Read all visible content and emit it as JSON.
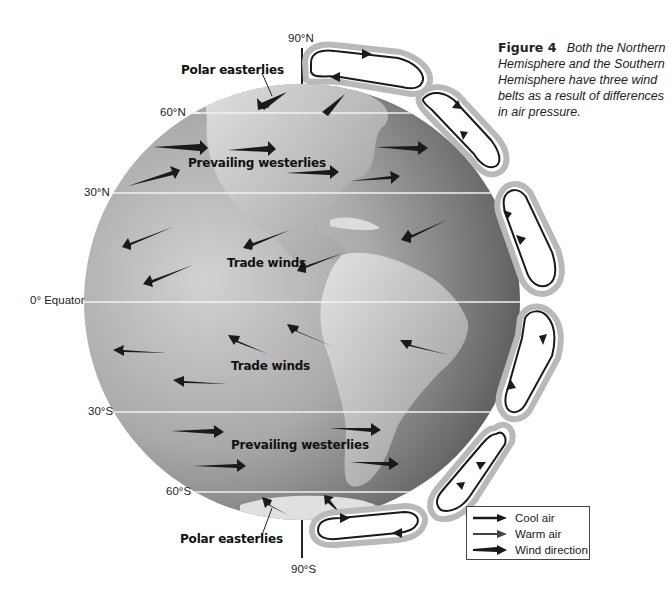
{
  "caption": {
    "figure_label": "Figure 4",
    "text": "Both the Northern Hemisphere and the Southern Hemisphere have three wind belts as a result of differences in air pressure."
  },
  "latitude_labels": {
    "n90": "90°N",
    "n60": "60°N",
    "n30": "30°N",
    "equator": "0° Equator",
    "s30": "30°S",
    "s60": "60°S",
    "s90": "90°S"
  },
  "wind_labels": {
    "polar_easterlies_north": "Polar easterlies",
    "prevailing_westerlies_north": "Prevailing westerlies",
    "trade_winds_north": "Trade winds",
    "trade_winds_south": "Trade winds",
    "prevailing_westerlies_south": "Prevailing westerlies",
    "polar_easterlies_south": "Polar easterlies"
  },
  "legend": {
    "items": [
      {
        "label": "Cool air",
        "icon": "thin-arrow-icon"
      },
      {
        "label": "Warm air",
        "icon": "thin-arrow-icon"
      },
      {
        "label": "Wind direction",
        "icon": "wind-arrow-icon"
      }
    ]
  },
  "colors": {
    "globe_light": "#c9c9c9",
    "globe_dark": "#4a4a4a",
    "cell_fill": "#ffffff",
    "cell_border": "#b5b5b5",
    "arrow": "#1a1a1a",
    "lat_line": "#f2f2f2"
  }
}
